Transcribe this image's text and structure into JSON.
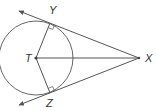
{
  "diagram": {
    "colors": {
      "stroke": "#555555",
      "label": "#333333",
      "background": "#ffffff"
    },
    "points": {
      "T": {
        "label": "T",
        "x": 36,
        "y": 58
      },
      "X": {
        "label": "X",
        "x": 139,
        "y": 58
      },
      "Y": {
        "label": "Y",
        "x": 50,
        "y": 23
      },
      "Z": {
        "label": "Z",
        "x": 50,
        "y": 93
      }
    },
    "circle": {
      "center": "T",
      "radius": 37
    },
    "segments": [
      {
        "from": "T",
        "to": "X"
      },
      {
        "from": "T",
        "to": "Y"
      },
      {
        "from": "T",
        "to": "Z"
      }
    ],
    "rays": [
      {
        "from": "X",
        "through": "Y",
        "arrow": true
      },
      {
        "from": "X",
        "through": "Z",
        "arrow": true
      }
    ],
    "right_angles": [
      "Y",
      "Z"
    ],
    "labels": {
      "Y": "Y",
      "T": "T",
      "X": "X",
      "Z": "Z"
    }
  }
}
